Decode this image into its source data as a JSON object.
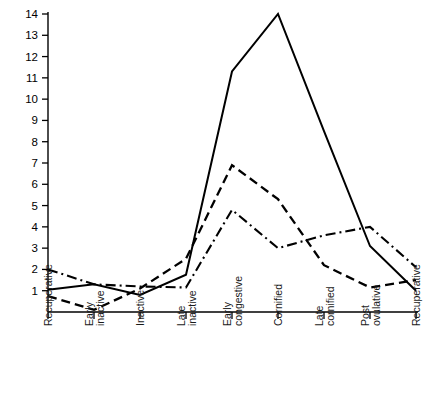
{
  "chart_data": {
    "type": "line",
    "title": "",
    "subtitle": "",
    "xlabel": "",
    "ylabel": "",
    "grid": false,
    "legend_position": "none",
    "categories": [
      "Recuperative",
      "Early inactive",
      "Inactive",
      "Late inactive",
      "Early congestive",
      "Cornified",
      "Late cornified",
      "Post ovulative",
      "Recuperative"
    ],
    "category_lines": [
      [
        "Recuperative"
      ],
      [
        "Early",
        "inactive"
      ],
      [
        "Inactive"
      ],
      [
        "Late",
        "inactive"
      ],
      [
        "Early",
        "congestive"
      ],
      [
        "Cornified"
      ],
      [
        "Late",
        "cornified"
      ],
      [
        "Post",
        "ovulative"
      ],
      [
        "Recuperative"
      ]
    ],
    "ylim": [
      0,
      14
    ],
    "yticks": [
      1,
      2,
      3,
      4,
      5,
      6,
      7,
      8,
      9,
      10,
      11,
      12,
      13,
      14
    ],
    "ytick_labels": [
      "1",
      "2",
      "3",
      "4",
      "5",
      "6",
      "7",
      "8",
      "9",
      "10",
      "11",
      "12",
      "13",
      "14"
    ],
    "series": [
      {
        "name": "solid",
        "style": "solid",
        "dasharray": "none",
        "width": 2.0,
        "color": "#000000",
        "values": [
          1.05,
          1.3,
          0.8,
          1.75,
          11.3,
          14.0,
          8.5,
          3.1,
          1.0
        ]
      },
      {
        "name": "dashed",
        "style": "dashed",
        "dasharray": "9,5",
        "width": 2.3,
        "color": "#000000",
        "values": [
          0.75,
          0.1,
          1.1,
          2.5,
          6.9,
          5.3,
          2.2,
          1.15,
          1.5
        ]
      },
      {
        "name": "dash-dot",
        "style": "dashdot",
        "dasharray": "10,4,2,4",
        "width": 2.1,
        "color": "#000000",
        "values": [
          2.0,
          1.3,
          1.2,
          1.15,
          4.8,
          3.0,
          3.6,
          4.0,
          2.1
        ]
      }
    ],
    "axis_color": "#000000",
    "background": "#ffffff"
  },
  "geometry": {
    "plot_left": 48,
    "plot_right": 416,
    "plot_top": 14,
    "plot_bottom": 312
  }
}
